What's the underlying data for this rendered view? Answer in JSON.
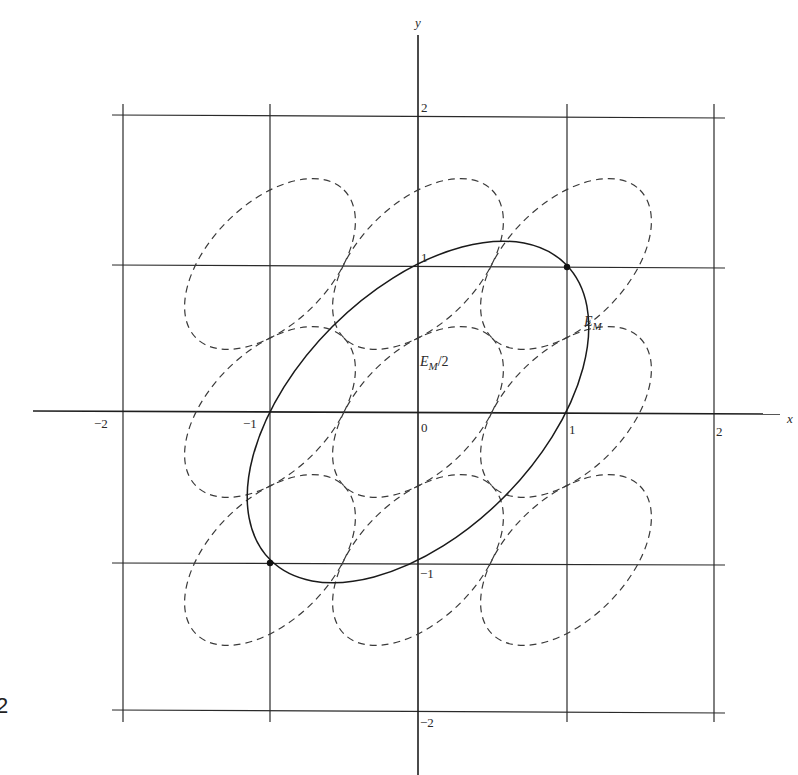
{
  "figure": {
    "axes": {
      "x_label": "x",
      "y_label": "y",
      "x_ticks": [
        "−2",
        "−1",
        "0",
        "1",
        "2"
      ],
      "y_ticks": [
        "2",
        "1",
        "−1",
        "−2"
      ],
      "range": [
        -2,
        2
      ]
    },
    "labels": {
      "solid_ellipse": {
        "main": "E",
        "sub": "M",
        "suffix": ""
      },
      "dashed_ellipse": {
        "main": "E",
        "sub": "M",
        "suffix": "/2"
      }
    },
    "solid_ellipse": {
      "equation": "x^2 - xy + y^2 = 1",
      "center": [
        0,
        0
      ],
      "passes_through": [
        [
          1,
          1
        ],
        [
          -1,
          -1
        ]
      ]
    },
    "dashed_ellipses": {
      "equation": "x^2 - xy + y^2 = 1/4 (translated)",
      "centers": [
        [
          -1,
          1
        ],
        [
          0,
          1
        ],
        [
          1,
          1
        ],
        [
          -1,
          0
        ],
        [
          0,
          0
        ],
        [
          1,
          0
        ],
        [
          -1,
          -1
        ],
        [
          0,
          -1
        ],
        [
          1,
          -1
        ]
      ]
    },
    "marked_points": [
      [
        1,
        1
      ],
      [
        -1,
        -1
      ]
    ],
    "page_fragment": "2"
  }
}
